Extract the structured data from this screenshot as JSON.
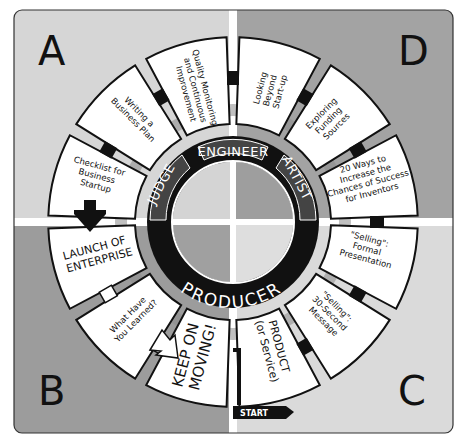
{
  "colors": {
    "quadrant_a": "#d6d6d6",
    "quadrant_b": "#9c9c9c",
    "quadrant_c": "#dadada",
    "quadrant_d": "#a3a3a3",
    "ring_dark": "#111111",
    "ring_tab": "#444444",
    "divider": "#ffffff",
    "segment_fill": "#ffffff"
  },
  "quadrants": {
    "a": {
      "letter": "A"
    },
    "b": {
      "letter": "B"
    },
    "c": {
      "letter": "C"
    },
    "d": {
      "letter": "D"
    }
  },
  "ring": {
    "top": "ENGINEER",
    "right": "ARTIST",
    "left": "JUDGE",
    "bottom": "PRODUCER"
  },
  "segments": [
    {
      "id": "quality",
      "lines": [
        "Quality Monitoring",
        "and Continuous",
        "Improvement"
      ]
    },
    {
      "id": "looking-beyond",
      "lines": [
        "Looking",
        "Beyond",
        "Start-up"
      ]
    },
    {
      "id": "exploring-funding",
      "lines": [
        "Exploring",
        "Funding",
        "Sources"
      ]
    },
    {
      "id": "twenty-ways",
      "lines": [
        "20 Ways to",
        "Increase the",
        "Chances of Success",
        "for Inventors"
      ]
    },
    {
      "id": "selling-formal",
      "lines": [
        "\"Selling\":",
        "Formal",
        "Presentation"
      ]
    },
    {
      "id": "selling-30",
      "lines": [
        "\"Selling\":",
        "30-Second",
        "Message"
      ]
    },
    {
      "id": "product",
      "lines": [
        "PRODUCT",
        "(or Service)"
      ]
    },
    {
      "id": "keep-moving",
      "lines": [
        "KEEP ON",
        "MOVING!"
      ]
    },
    {
      "id": "what-learned",
      "lines": [
        "What Have",
        "You Learned?"
      ]
    },
    {
      "id": "launch",
      "lines": [
        "LAUNCH OF",
        "ENTERPRISE"
      ]
    },
    {
      "id": "checklist",
      "lines": [
        "Checklist for",
        "Business",
        "Startup"
      ]
    },
    {
      "id": "writing-plan",
      "lines": [
        "Writing a",
        "Business Plan"
      ]
    }
  ],
  "start_label": "START"
}
